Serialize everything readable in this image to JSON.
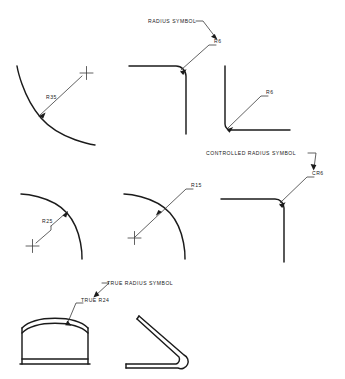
{
  "drawing": {
    "title": "Radius Dimensioning Symbols Reference",
    "background_color": "#ffffff",
    "line_color": "#1b1b1b",
    "thin_line_color": "#3a3a3a",
    "figures": [
      {
        "id": "fig-r35",
        "row": 1,
        "position": "left",
        "kind": "arc-with-center-mark",
        "dimension_label": "R35",
        "has_center_mark": true,
        "has_leader_arrow": true
      },
      {
        "id": "fig-radius-symbol-corner",
        "row": 1,
        "position": "center",
        "kind": "filleted-corner",
        "dimension_label": "R6",
        "note_label": "RADIUS SYMBOL",
        "has_center_mark": false,
        "has_leader_arrow": true
      },
      {
        "id": "fig-r6-corner",
        "row": 1,
        "position": "right",
        "kind": "small-fillet-corner",
        "dimension_label": "R6",
        "has_center_mark": false,
        "has_leader_arrow": true
      },
      {
        "id": "fig-r25",
        "row": 2,
        "position": "left",
        "kind": "arc-with-center-mark",
        "dimension_label": "R25",
        "has_center_mark": true,
        "has_leader_arrow": true
      },
      {
        "id": "fig-r15",
        "row": 2,
        "position": "center",
        "kind": "arc-with-center-mark",
        "dimension_label": "R15",
        "has_center_mark": true,
        "has_leader_arrow": true
      },
      {
        "id": "fig-cr6-corner",
        "row": 2,
        "position": "right",
        "kind": "controlled-radius-corner",
        "dimension_label": "CR6",
        "note_label": "CONTROLLED RADIUS SYMBOL",
        "has_center_mark": false,
        "has_leader_arrow": true
      },
      {
        "id": "fig-true-r24-arched-part",
        "row": 3,
        "position": "left",
        "kind": "arched-sheet-part",
        "dimension_label": "TRUE R24",
        "note_label": "TRUE RADIUS SYMBOL",
        "has_center_mark": false,
        "has_leader_arrow": true
      },
      {
        "id": "fig-bent-sheet-part",
        "row": 3,
        "position": "center",
        "kind": "bent-sheet-part",
        "dimension_label": "",
        "has_center_mark": false,
        "has_leader_arrow": false
      }
    ],
    "labels": {
      "radius_symbol_note": "RADIUS SYMBOL",
      "controlled_radius_symbol_note": "CONTROLLED RADIUS SYMBOL",
      "true_radius_symbol_note": "TRUE RADIUS SYMBOL",
      "r35": "R35",
      "r6_top": "R6",
      "r6_right": "R6",
      "r25": "R25",
      "r15": "R15",
      "cr6": "CR6",
      "true_r24": "TRUE R24"
    }
  }
}
